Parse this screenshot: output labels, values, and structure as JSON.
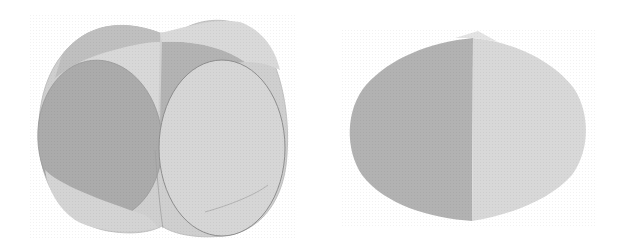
{
  "figures": [
    {
      "id": "union",
      "description": "Union of two perpendicular cylinders",
      "colors": {
        "outer": "#cfcfcf",
        "dark": "#a9a9a9",
        "mid": "#bdbdbd",
        "light": "#d6d6d6",
        "lighter": "#dcdcdc",
        "edge": "#8c8c8c"
      }
    },
    {
      "id": "intersection",
      "description": "Intersection of two perpendicular cylinders (Steinmetz solid)",
      "colors": {
        "dark": "#b0b0b0",
        "light": "#d7d7d7",
        "cap": "#e2e2e2"
      }
    }
  ]
}
